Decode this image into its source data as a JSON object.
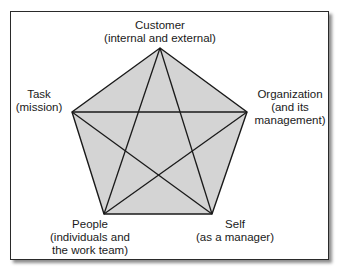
{
  "diagram": {
    "type": "pentagram-in-pentagon",
    "fill_color": "#d4d4d4",
    "line_color": "#1a1a1a",
    "nodes": [
      {
        "id": "customer",
        "title": "Customer",
        "subtitle": "(internal and external)"
      },
      {
        "id": "organization",
        "title": "Organization",
        "subtitle1": "(and its",
        "subtitle2": "management)"
      },
      {
        "id": "self",
        "title": "Self",
        "subtitle": "(as a manager)"
      },
      {
        "id": "people",
        "title": "People",
        "subtitle1": "(individuals and",
        "subtitle2": "the work team)"
      },
      {
        "id": "task",
        "title": "Task",
        "subtitle": "(mission)"
      }
    ],
    "edges": "every node connected to every other node"
  }
}
